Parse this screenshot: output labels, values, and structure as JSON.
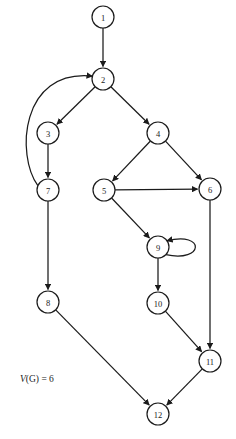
{
  "figure": {
    "name": "control-flow-graph",
    "background_color": "#ffffff",
    "stroke_color": "#1b1b1b"
  },
  "chart_data": {
    "type": "diagram",
    "title": "",
    "xlabel": "",
    "ylabel": "",
    "layout": {
      "width": 236,
      "height": 439,
      "node_radius": 11,
      "directed": true,
      "grid": false,
      "legend": "none"
    },
    "nodes": [
      {
        "id": "1",
        "label": "1",
        "x": 103,
        "y": 17
      },
      {
        "id": "2",
        "label": "2",
        "x": 103,
        "y": 79
      },
      {
        "id": "3",
        "label": "3",
        "x": 48,
        "y": 133
      },
      {
        "id": "4",
        "label": "4",
        "x": 158,
        "y": 133
      },
      {
        "id": "5",
        "label": "5",
        "x": 104,
        "y": 190
      },
      {
        "id": "6",
        "label": "6",
        "x": 210,
        "y": 189
      },
      {
        "id": "7",
        "label": "7",
        "x": 48,
        "y": 190
      },
      {
        "id": "8",
        "label": "8",
        "x": 48,
        "y": 302
      },
      {
        "id": "9",
        "label": "9",
        "x": 158,
        "y": 247
      },
      {
        "id": "10",
        "label": "10",
        "x": 158,
        "y": 303
      },
      {
        "id": "11",
        "label": "11",
        "x": 210,
        "y": 361
      },
      {
        "id": "12",
        "label": "12",
        "x": 158,
        "y": 414
      }
    ],
    "edges": [
      {
        "from": "1",
        "to": "2",
        "kind": "straight"
      },
      {
        "from": "2",
        "to": "3",
        "kind": "straight"
      },
      {
        "from": "2",
        "to": "4",
        "kind": "straight"
      },
      {
        "from": "3",
        "to": "7",
        "kind": "straight"
      },
      {
        "from": "7",
        "to": "2",
        "kind": "curved-back"
      },
      {
        "from": "7",
        "to": "8",
        "kind": "straight"
      },
      {
        "from": "4",
        "to": "5",
        "kind": "straight"
      },
      {
        "from": "4",
        "to": "6",
        "kind": "straight"
      },
      {
        "from": "5",
        "to": "6",
        "kind": "straight"
      },
      {
        "from": "5",
        "to": "9",
        "kind": "straight"
      },
      {
        "from": "9",
        "to": "9",
        "kind": "self-loop"
      },
      {
        "from": "9",
        "to": "10",
        "kind": "straight"
      },
      {
        "from": "6",
        "to": "11",
        "kind": "straight"
      },
      {
        "from": "10",
        "to": "11",
        "kind": "straight"
      },
      {
        "from": "8",
        "to": "12",
        "kind": "straight"
      },
      {
        "from": "11",
        "to": "12",
        "kind": "straight"
      }
    ],
    "annotations": [
      {
        "id": "cyclomatic-complexity",
        "variable": "V",
        "text": "(G) = 6",
        "full_text": "V(G) = 6",
        "value": 6,
        "x": 20,
        "y": 382
      }
    ]
  }
}
